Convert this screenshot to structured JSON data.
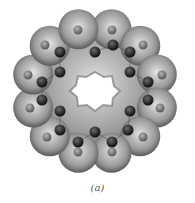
{
  "figure": {
    "caption": "(a)",
    "lobes": 12,
    "hole_shape": "hexagonal-star",
    "colors": {
      "background": "#ffffff",
      "surface_dark": "#6e6e6e",
      "surface_light": "#c8c8c8",
      "atom_dark": "#262626",
      "atom_light": "#8a8a8a"
    },
    "atoms_outer": [
      {
        "x": 45,
        "y": 45
      },
      {
        "x": 78,
        "y": 30
      },
      {
        "x": 112,
        "y": 30
      },
      {
        "x": 143,
        "y": 45
      },
      {
        "x": 162,
        "y": 75
      },
      {
        "x": 160,
        "y": 108
      },
      {
        "x": 143,
        "y": 137
      },
      {
        "x": 112,
        "y": 152
      },
      {
        "x": 78,
        "y": 152
      },
      {
        "x": 47,
        "y": 137
      },
      {
        "x": 30,
        "y": 108
      },
      {
        "x": 28,
        "y": 75
      }
    ],
    "atoms_inner": [
      {
        "x": 60,
        "y": 52
      },
      {
        "x": 95,
        "y": 52
      },
      {
        "x": 113,
        "y": 45
      },
      {
        "x": 130,
        "y": 52
      },
      {
        "x": 60,
        "y": 72
      },
      {
        "x": 130,
        "y": 72
      },
      {
        "x": 42,
        "y": 82
      },
      {
        "x": 148,
        "y": 82
      },
      {
        "x": 42,
        "y": 100
      },
      {
        "x": 148,
        "y": 100
      },
      {
        "x": 60,
        "y": 111
      },
      {
        "x": 130,
        "y": 111
      },
      {
        "x": 60,
        "y": 130
      },
      {
        "x": 95,
        "y": 132
      },
      {
        "x": 128,
        "y": 130
      },
      {
        "x": 78,
        "y": 142
      },
      {
        "x": 112,
        "y": 142
      }
    ]
  }
}
